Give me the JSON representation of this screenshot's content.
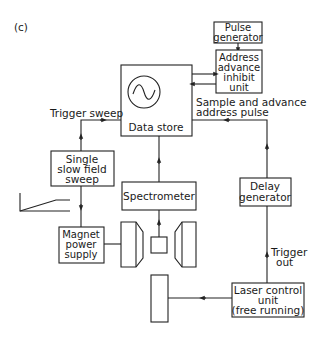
{
  "figure": {
    "panel_label": "(c)"
  },
  "blocks": {
    "pulse_generator": {
      "lines": [
        "Pulse",
        "generator"
      ]
    },
    "address_advance_inhibit": {
      "lines": [
        "Address",
        "advance",
        "inhibit",
        "unit"
      ]
    },
    "data_store": {
      "label": "Data store",
      "icon": "oscilloscope-sine-icon"
    },
    "single_slow_field_sweep": {
      "lines": [
        "Single",
        "slow field",
        "sweep"
      ]
    },
    "spectrometer": {
      "label": "Spectrometer"
    },
    "delay_generator": {
      "lines": [
        "Delay",
        "generator"
      ]
    },
    "magnet_power_supply": {
      "lines": [
        "Magnet",
        "power",
        "supply"
      ]
    },
    "laser_control_unit": {
      "lines": [
        "Laser control",
        "unit",
        "(free running)"
      ]
    }
  },
  "signals": {
    "trigger_sweep": "Trigger sweep",
    "sample_advance": [
      "Sample and advance",
      "address pulse"
    ],
    "trigger_out": [
      "Trigger",
      "out"
    ]
  },
  "graphics": {
    "ramp": "ramp-waveform-icon",
    "magnet_poles": "magnet-pole-pieces",
    "sample": "sample-cell",
    "laser": "laser-head"
  }
}
